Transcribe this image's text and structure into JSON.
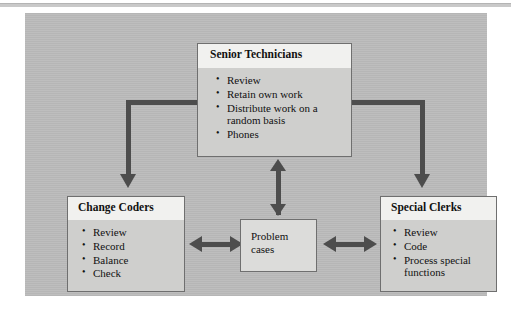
{
  "diagram": {
    "type": "organizational-work-flow",
    "background_color": "#bcbcbc",
    "connector_color": "#4d4d4d",
    "box_header_color": "#f1f1ef",
    "box_body_color": "#cfcfcd",
    "boxes": [
      {
        "id": "senior-technicians",
        "title": "Senior Technicians",
        "items": [
          "Review",
          "Retain own work",
          "Distribute work on a random basis",
          "Phones"
        ]
      },
      {
        "id": "change-coders",
        "title": "Change Coders",
        "items": [
          "Review",
          "Record",
          "Balance",
          "Check"
        ]
      },
      {
        "id": "special-clerks",
        "title": "Special Clerks",
        "items": [
          "Review",
          "Code",
          "Process special functions"
        ]
      }
    ],
    "hub": {
      "id": "problem-cases",
      "line1": "Problem",
      "line2": "cases"
    },
    "connectors": [
      {
        "id": "senior-to-change-coders",
        "from": "senior-technicians",
        "to": "change-coders",
        "style": "elbow",
        "heads": "single"
      },
      {
        "id": "senior-to-special-clerks",
        "from": "senior-technicians",
        "to": "special-clerks",
        "style": "elbow",
        "heads": "single"
      },
      {
        "id": "senior-to-problem-cases",
        "from": "senior-technicians",
        "to": "problem-cases",
        "style": "vertical",
        "heads": "double"
      },
      {
        "id": "change-coders-to-problem-cases",
        "from": "change-coders",
        "to": "problem-cases",
        "style": "horizontal",
        "heads": "double"
      },
      {
        "id": "problem-cases-to-special-clerks",
        "from": "problem-cases",
        "to": "special-clerks",
        "style": "horizontal",
        "heads": "double"
      }
    ]
  }
}
